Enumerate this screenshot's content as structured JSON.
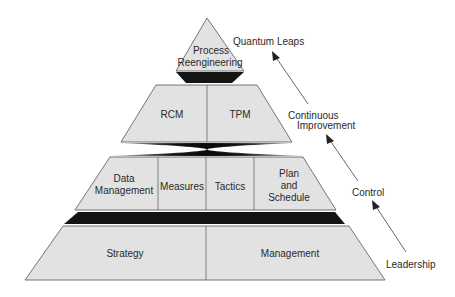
{
  "diagram": {
    "type": "pyramid",
    "tiers": [
      {
        "level": "top",
        "cells": [
          "Process\nReengineering"
        ]
      },
      {
        "level": "second",
        "cells": [
          "RCM",
          "TPM"
        ]
      },
      {
        "level": "third",
        "cells": [
          "Data\nManagement",
          "Measures",
          "Tactics",
          "Plan\nand\nSchedule"
        ]
      },
      {
        "level": "base",
        "cells": [
          "Strategy",
          "Management"
        ]
      }
    ],
    "labels": {
      "top_line1": "Process",
      "top_line2": "Reengineering",
      "rcm": "RCM",
      "tpm": "TPM",
      "data_line1": "Data",
      "data_line2": "Management",
      "measures": "Measures",
      "tactics": "Tactics",
      "plan_line1": "Plan",
      "plan_line2": "and",
      "plan_line3": "Schedule",
      "strategy": "Strategy",
      "management": "Management"
    },
    "side_annotations": {
      "quantum_leaps": "Quantum Leaps",
      "continuous_line1": "Continuous",
      "continuous_line2": "Improvement",
      "control": "Control",
      "leadership": "Leadership"
    },
    "colors": {
      "tier_fill": "#e2e2e2",
      "band_fill": "#141414",
      "outline": "#555555",
      "text": "#2a2a2a"
    }
  }
}
